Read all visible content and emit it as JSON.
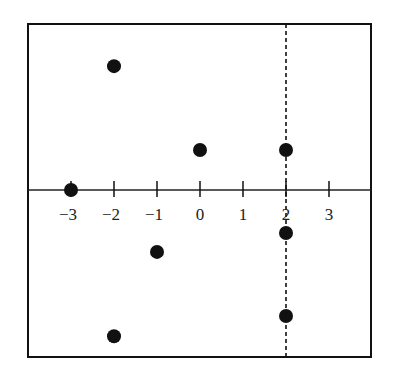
{
  "chart_data": {
    "type": "scatter",
    "title": "",
    "xlabel": "",
    "ylabel": "",
    "x_ticks": [
      -3,
      -2,
      -1,
      0,
      1,
      2,
      3
    ],
    "x_tick_labels": [
      "−3",
      "−2",
      "−1",
      "0",
      "1",
      "2",
      "3"
    ],
    "xlim": [
      -3.67,
      4.0
    ],
    "ylim": [
      -3.85,
      3.88
    ],
    "y_axis_labels_shown": false,
    "grid": false,
    "legend": null,
    "reference_lines": [
      {
        "orientation": "vertical",
        "x": 2,
        "style": "dashed"
      }
    ],
    "points": [
      {
        "x": -2,
        "y": 2.88
      },
      {
        "x": 0,
        "y": 0.93
      },
      {
        "x": 2,
        "y": 0.93
      },
      {
        "x": -3,
        "y": 0
      },
      {
        "x": 2,
        "y": -1.0
      },
      {
        "x": -1,
        "y": -1.44
      },
      {
        "x": 2,
        "y": -2.93
      },
      {
        "x": -2,
        "y": -3.4
      }
    ]
  },
  "layout": {
    "frame": {
      "left": 28,
      "top": 24,
      "right": 371,
      "bottom": 357
    },
    "origin_px": {
      "x": 200,
      "y": 190
    },
    "unit_px": 43,
    "colors": {
      "ink": "#111111",
      "background": "#ffffff"
    }
  }
}
